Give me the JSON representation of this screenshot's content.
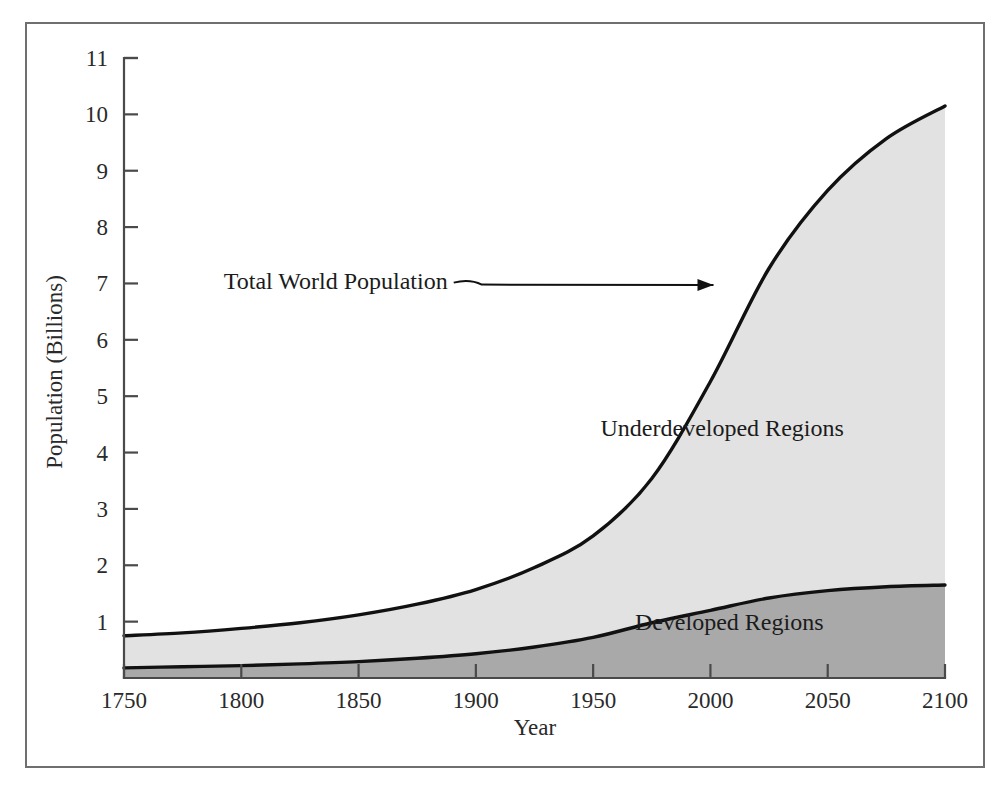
{
  "figure": {
    "background_color": "#ffffff",
    "frame_color": "#6f6f6f"
  },
  "chart_data": {
    "type": "area",
    "title": "",
    "subtitle": "",
    "xlabel": "Year",
    "ylabel": "Population (Billions)",
    "xlim": [
      1750,
      2100
    ],
    "ylim": [
      0,
      11
    ],
    "grid": false,
    "legend_position": "inline-annotations",
    "stacked": true,
    "x_ticks": [
      1750,
      1800,
      1850,
      1900,
      1950,
      2000,
      2050,
      2100
    ],
    "x_tick_labels": [
      "1750",
      "1800",
      "1850",
      "1900",
      "1950",
      "2000",
      "2050",
      "2100"
    ],
    "y_ticks": [
      1,
      2,
      3,
      4,
      5,
      6,
      7,
      8,
      9,
      10,
      11
    ],
    "y_tick_labels": [
      "1",
      "2",
      "3",
      "4",
      "5",
      "6",
      "7",
      "8",
      "9",
      "10",
      "11"
    ],
    "x": [
      1750,
      1775,
      1800,
      1825,
      1850,
      1875,
      1900,
      1925,
      1950,
      1975,
      2000,
      2025,
      2050,
      2075,
      2100
    ],
    "series": [
      {
        "name": "Developed Regions",
        "fill_color": "#a9a9a9",
        "line_color": "#111111",
        "values": [
          0.18,
          0.2,
          0.22,
          0.25,
          0.29,
          0.35,
          0.43,
          0.55,
          0.72,
          0.98,
          1.2,
          1.42,
          1.55,
          1.62,
          1.65
        ]
      },
      {
        "name": "Underdeveloped Regions",
        "fill_color": "#e2e2e2",
        "line_color": "#111111",
        "values": [
          0.57,
          0.6,
          0.66,
          0.73,
          0.83,
          0.96,
          1.14,
          1.41,
          1.8,
          2.56,
          4.06,
          5.85,
          7.1,
          7.95,
          8.5
        ]
      }
    ],
    "total_series": {
      "name": "Total World Population",
      "line_color": "#111111",
      "values": [
        0.75,
        0.8,
        0.88,
        0.98,
        1.12,
        1.31,
        1.57,
        1.96,
        2.52,
        3.54,
        5.26,
        7.27,
        8.65,
        9.57,
        10.15
      ]
    },
    "annotations": [
      {
        "text": "Total World Population",
        "target_x": 2003,
        "target_y": 6.9,
        "label_x": 1888,
        "label_y": 7.05
      }
    ],
    "area_labels": [
      {
        "text": "Underdeveloped Regions",
        "x": 2005,
        "y": 4.3
      },
      {
        "text": "Developed Regions",
        "x": 2008,
        "y": 0.85
      }
    ]
  }
}
